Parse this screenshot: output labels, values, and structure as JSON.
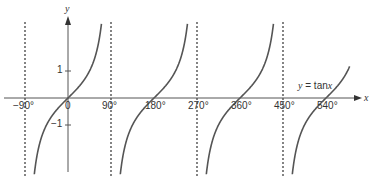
{
  "chart_data": {
    "type": "line",
    "title": "",
    "xlabel": "x",
    "ylabel": "y",
    "function": "y = tan x",
    "legend_label_prefix": "y = tan",
    "legend_label_var": "x",
    "x_ticks": [
      "−90°",
      "0",
      "90°",
      "180°",
      "270°",
      "360°",
      "450°",
      "540°"
    ],
    "x_tick_values": [
      -90,
      0,
      90,
      180,
      270,
      360,
      450,
      540
    ],
    "y_ticks": [
      "1",
      "−1"
    ],
    "y_tick_values": [
      1,
      -1
    ],
    "asymptotes_deg": [
      -90,
      90,
      270,
      450
    ],
    "xlim": [
      -105,
      590
    ],
    "ylim": [
      -2.8,
      2.8
    ],
    "grid": false,
    "series": [
      {
        "name": "tan x branch 1",
        "x": [
          -88,
          -60,
          -45,
          -30,
          0,
          30,
          45,
          60,
          88
        ],
        "values": [
          -28.6,
          -1.73,
          -1,
          -0.58,
          0,
          0.58,
          1,
          1.73,
          28.6
        ]
      },
      {
        "name": "tan x branch 2",
        "x": [
          92,
          120,
          135,
          150,
          180,
          210,
          225,
          240,
          268
        ],
        "values": [
          -28.6,
          -1.73,
          -1,
          -0.58,
          0,
          0.58,
          1,
          1.73,
          28.6
        ]
      },
      {
        "name": "tan x branch 3",
        "x": [
          272,
          300,
          315,
          330,
          360,
          390,
          405,
          420,
          448
        ],
        "values": [
          -28.6,
          -1.73,
          -1,
          -0.58,
          0,
          0.58,
          1,
          1.73,
          28.6
        ]
      },
      {
        "name": "tan x branch 4",
        "x": [
          452,
          480,
          495,
          510,
          540,
          570
        ],
        "values": [
          -28.6,
          -1.73,
          -1,
          -0.58,
          0,
          0.58
        ]
      }
    ],
    "colors": {
      "curve": "#555555",
      "axis": "#444444",
      "asymptote": "#333333"
    }
  }
}
